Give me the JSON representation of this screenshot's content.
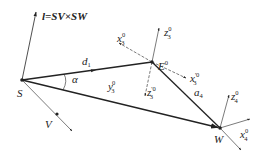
{
  "diagram": {
    "type": "geometric vector diagram",
    "points": {
      "S": {
        "label": "S",
        "x": 22,
        "y": 80
      },
      "E": {
        "label": "E",
        "sup": "0",
        "x": 152,
        "y": 62
      },
      "W": {
        "label": "W",
        "x": 220,
        "y": 128
      },
      "V": {
        "label": "V",
        "x": 57,
        "y": 114
      }
    },
    "labels": {
      "normal": "l=SV×SW",
      "d": "d",
      "d_sub": "1",
      "alpha": "α",
      "y": "y",
      "y_sub": "3",
      "y_sup": "0",
      "a": "a",
      "a_sub": "4",
      "x3": "x",
      "x3_sub": "3",
      "x3_sup": "0",
      "z3": "z",
      "z3_sub": "3",
      "z3_sup": "0",
      "x3p": "x",
      "x3p_sub": "3",
      "x3p_sup": "'0",
      "z3p": "z",
      "z3p_sub": "3",
      "z3p_sup": "'0",
      "z4": "z",
      "z4_sub": "4",
      "z4_sup": "0",
      "x4": "x",
      "x4_sub": "4",
      "x4_sup": "0",
      "E_label": "E",
      "E_sup": "0",
      "S_label": "S",
      "W_label": "W",
      "V_label": "V"
    },
    "colors": {
      "line": "#222222",
      "background": "#ffffff"
    }
  }
}
